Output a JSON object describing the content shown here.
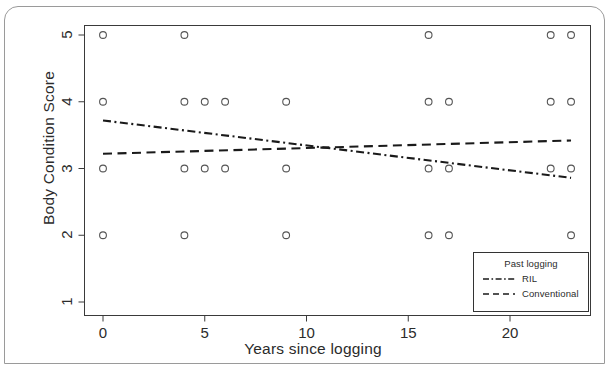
{
  "chart_data": {
    "type": "scatter",
    "title": "",
    "xlabel": "Years since logging",
    "ylabel": "Body Condition Score",
    "xlim": [
      -1.2,
      24.0
    ],
    "ylim": [
      0.6,
      5.25
    ],
    "xticks": [
      0,
      5,
      10,
      15,
      20
    ],
    "yticks": [
      1,
      2,
      3,
      4,
      5
    ],
    "xtick_labels": [
      "0",
      "5",
      "10",
      "15",
      "20"
    ],
    "ytick_labels": [
      "1",
      "2",
      "3",
      "4",
      "5"
    ],
    "grid": false,
    "legend_position": "bottom-right",
    "points": {
      "name": "Body condition observations",
      "marker": "open-circle",
      "x": [
        0,
        4,
        16,
        22,
        23,
        0,
        4,
        5,
        6,
        9,
        16,
        17,
        22,
        23,
        0,
        4,
        5,
        6,
        9,
        16,
        17,
        22,
        23,
        0,
        4,
        9,
        16,
        17,
        23
      ],
      "y": [
        5,
        5,
        5,
        5,
        5,
        4,
        4,
        4,
        4,
        4,
        4,
        4,
        4,
        4,
        3,
        3,
        3,
        3,
        3,
        3,
        3,
        3,
        3,
        2,
        2,
        2,
        2,
        2,
        2
      ]
    },
    "series": [
      {
        "name": "RIL",
        "style": "dash-dot",
        "x": [
          0,
          23
        ],
        "y": [
          3.72,
          2.86
        ]
      },
      {
        "name": "Conventional",
        "style": "dashed",
        "x": [
          0,
          23
        ],
        "y": [
          3.22,
          3.42
        ]
      }
    ],
    "legend": {
      "title": "Past logging",
      "entries": [
        {
          "label": "RIL",
          "style": "dash-dot"
        },
        {
          "label": "Conventional",
          "style": "dashed"
        }
      ]
    }
  },
  "axes": {
    "y_title": "Body Condition Score",
    "x_title": "Years since logging",
    "y_ticks": [
      "1",
      "2",
      "3",
      "4",
      "5"
    ],
    "x_ticks": [
      "0",
      "5",
      "10",
      "15",
      "20"
    ]
  },
  "legend": {
    "title": "Past logging",
    "entry_ril": "RIL",
    "entry_conventional": "Conventional"
  },
  "colors": {
    "ink": "#2b2b2b",
    "frame": "#9a9a9a",
    "marker": "#555555",
    "line": "#1a1a1a"
  }
}
